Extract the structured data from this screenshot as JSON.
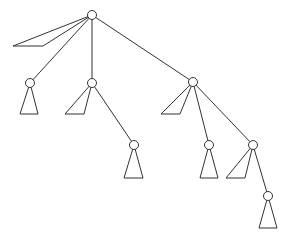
{
  "diagram": {
    "type": "tree",
    "style": {
      "stroke": "#333333",
      "background": "#ffffff",
      "node_radius": 4.5
    },
    "nodes": [
      {
        "id": "root",
        "x": 92,
        "y": 15
      },
      {
        "id": "n1",
        "x": 30,
        "y": 83
      },
      {
        "id": "n2",
        "x": 92,
        "y": 83
      },
      {
        "id": "n3",
        "x": 193,
        "y": 82
      },
      {
        "id": "n4",
        "x": 134,
        "y": 145
      },
      {
        "id": "n5",
        "x": 209,
        "y": 145
      },
      {
        "id": "n6",
        "x": 253,
        "y": 145
      },
      {
        "id": "n7",
        "x": 268,
        "y": 196
      }
    ],
    "edges": [
      [
        "root",
        "n1"
      ],
      [
        "root",
        "n2"
      ],
      [
        "root",
        "n3"
      ],
      [
        "n2",
        "n4"
      ],
      [
        "n3",
        "n5"
      ],
      [
        "n3",
        "n6"
      ],
      [
        "n6",
        "n7"
      ]
    ],
    "subtrees": [
      {
        "attached_to": "root",
        "points": [
          [
            92,
            15
          ],
          [
            13,
            46
          ],
          [
            43,
            46
          ]
        ]
      },
      {
        "attached_to": "n1",
        "points": [
          [
            30,
            83
          ],
          [
            20,
            114
          ],
          [
            38,
            114
          ]
        ]
      },
      {
        "attached_to": "n2",
        "points": [
          [
            92,
            83
          ],
          [
            65,
            114
          ],
          [
            84,
            114
          ]
        ]
      },
      {
        "attached_to": "n3",
        "points": [
          [
            193,
            82
          ],
          [
            161,
            114
          ],
          [
            180,
            114
          ]
        ]
      },
      {
        "attached_to": "n4",
        "points": [
          [
            134,
            145
          ],
          [
            124,
            178
          ],
          [
            143,
            178
          ]
        ]
      },
      {
        "attached_to": "n5",
        "points": [
          [
            209,
            145
          ],
          [
            200,
            178
          ],
          [
            218,
            178
          ]
        ]
      },
      {
        "attached_to": "n6",
        "points": [
          [
            253,
            145
          ],
          [
            226,
            178
          ],
          [
            245,
            178
          ]
        ]
      },
      {
        "attached_to": "n7",
        "points": [
          [
            268,
            196
          ],
          [
            259,
            228
          ],
          [
            277,
            228
          ]
        ]
      }
    ]
  }
}
